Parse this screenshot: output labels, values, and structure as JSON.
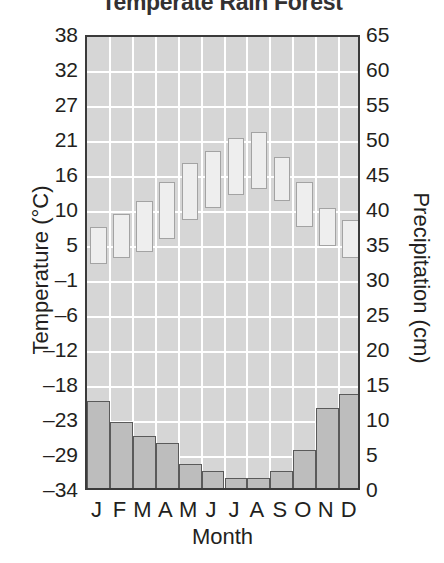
{
  "chart_data": {
    "type": "bar",
    "title": "Temperate Rain Forest",
    "xlabel": "Month",
    "ylabel": "Temperature (°C)",
    "ylabel_right": "Precipitation (cm)",
    "categories": [
      "J",
      "F",
      "M",
      "A",
      "M",
      "J",
      "J",
      "A",
      "S",
      "O",
      "N",
      "D"
    ],
    "month_names": [
      "January",
      "February",
      "March",
      "April",
      "May",
      "June",
      "July",
      "August",
      "September",
      "October",
      "November",
      "December"
    ],
    "grid": true,
    "legend": "none",
    "axes": {
      "left": {
        "label": "Temperature (°C)",
        "unit": "°C",
        "ylim": [
          -34,
          38
        ],
        "ticks": [
          38,
          32,
          27,
          21,
          16,
          10,
          5,
          -1,
          -6,
          -12,
          -18,
          -23,
          -29,
          -34
        ]
      },
      "right": {
        "label": "Precipitation (cm)",
        "unit": "cm",
        "ylim": [
          0,
          65
        ],
        "ticks": [
          65,
          60,
          55,
          50,
          45,
          40,
          35,
          30,
          25,
          20,
          15,
          10,
          5,
          0
        ]
      }
    },
    "series": [
      {
        "name": "Precipitation",
        "axis": "right",
        "unit": "cm",
        "type": "bar",
        "values": [
          13,
          10,
          8,
          7,
          4,
          3,
          2,
          2,
          3,
          6,
          12,
          14
        ]
      },
      {
        "name": "Temperature range",
        "axis": "left",
        "unit": "°C",
        "type": "range-bar",
        "low": [
          2,
          3,
          4,
          6,
          9,
          11,
          13,
          14,
          12,
          8,
          5,
          3
        ],
        "high": [
          8,
          10,
          12,
          15,
          18,
          20,
          22,
          23,
          19,
          15,
          11,
          9
        ]
      }
    ],
    "colors": {
      "plot_background": "#d6d6d6",
      "gridline": "#ffffff",
      "frame": "#3b3b3b",
      "precipitation_fill": "#bdbdbd",
      "precipitation_edge": "#5a5a5a",
      "temperature_fill": "#eeeeee",
      "temperature_edge": "#a3a3a3",
      "text": "#231f20"
    }
  }
}
